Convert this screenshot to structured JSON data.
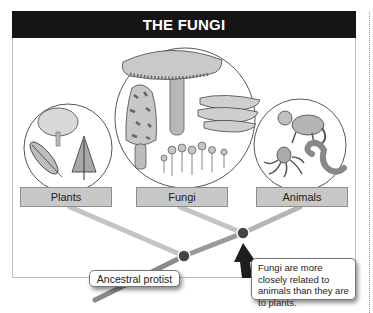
{
  "title": "THE FUNGI",
  "groups": [
    {
      "label": "Plants",
      "illustrations": [
        "tree",
        "fern",
        "conifer"
      ]
    },
    {
      "label": "Fungi",
      "illustrations": [
        "gilled-mushroom",
        "morel",
        "bracket-fungus",
        "slime-mold-stalks"
      ]
    },
    {
      "label": "Animals",
      "illustrations": [
        "monkey",
        "octopus",
        "worm"
      ]
    }
  ],
  "callouts": {
    "ancestor": "Ancestral protist",
    "note": "Fungi are more closely related to animals than they are to plants."
  },
  "colors": {
    "header_bg": "#151515",
    "label_bg": "#c8c8c8",
    "branch": "#bcbcbc",
    "node": "#444444"
  }
}
